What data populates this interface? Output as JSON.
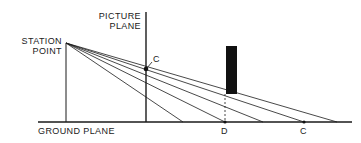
{
  "diagram": {
    "type": "perspective-projection",
    "labels": {
      "picture_plane_line1": "PICTURE",
      "picture_plane_line2": "PLANE",
      "station_point_line1": "STATION",
      "station_point_line2": "POINT",
      "ground_plane": "GROUND PLANE",
      "point_c_picture": "C",
      "point_d_ground": "D",
      "point_c_ground": "C"
    },
    "colors": {
      "line": "#1a1a1a",
      "object_fill": "#111111",
      "background": "#ffffff"
    },
    "geometry": {
      "station_point": [
        66,
        43
      ],
      "picture_plane_x": 146,
      "picture_plane_top": 12,
      "ground_y": 122,
      "ground_left": 38,
      "ground_right": 352,
      "object_rect": {
        "x": 226,
        "y": 46,
        "w": 11,
        "h": 48
      },
      "point_c_on_picture_plane": [
        146,
        69
      ],
      "point_d": [
        225,
        122
      ],
      "point_c_on_ground": [
        304,
        122
      ],
      "ray_endpoints_x": [
        183,
        225,
        263,
        304,
        337
      ]
    }
  }
}
